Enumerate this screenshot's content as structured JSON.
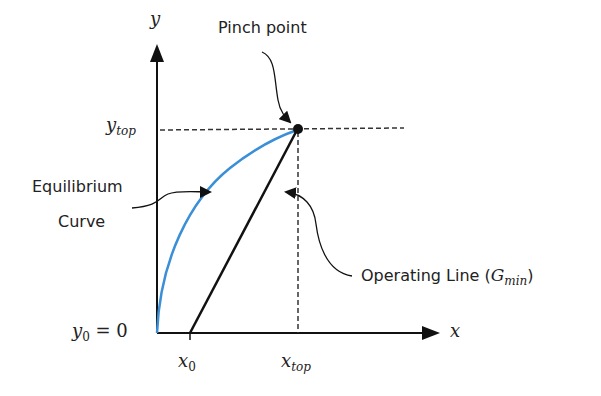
{
  "diagram": {
    "axes": {
      "y_label": "y",
      "x_label": "x",
      "origin_label": "y₀ = 0",
      "origin_label_var": "y",
      "origin_label_sub": "0",
      "origin_label_rest": " = 0"
    },
    "ticks": {
      "y_top_var": "y",
      "y_top_sub": "top",
      "x0_var": "x",
      "x0_sub": "0",
      "x_top_var": "x",
      "x_top_sub": "top"
    },
    "annotations": {
      "pinch_point": "Pinch point",
      "equilibrium_line1": "Equilibrium",
      "equilibrium_line2": "Curve",
      "operating_line_text": "Operating Line (",
      "operating_line_var": "G",
      "operating_line_sub": "min",
      "operating_line_close": ")"
    },
    "colors": {
      "equilibrium_curve": "#3a8fd6",
      "operating_line": "#111111",
      "axes": "#111111",
      "dashed": "#333333"
    }
  }
}
